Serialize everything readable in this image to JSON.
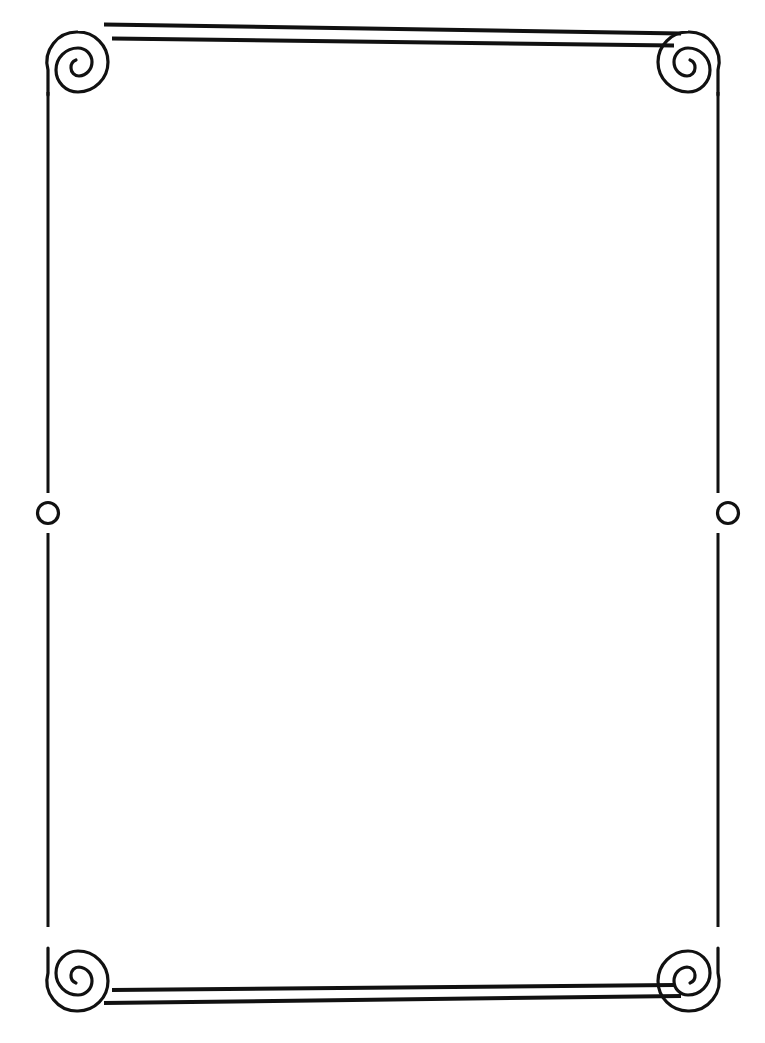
{
  "document": {
    "title": "Decorative Border Frame",
    "kind": "ornamental-page-border",
    "width": 765,
    "height": 1043,
    "background_color": "#ffffff",
    "ink_color": "#111111",
    "text_content": "",
    "interior_note": ""
  },
  "frame": {
    "stroke_color": "#111111",
    "stroke_width": 3,
    "left_rail_x": 48,
    "right_rail_x": 718,
    "top_rail_y": 62,
    "bottom_rail_y": 957
  },
  "corners": [
    {
      "name": "top-left-spiral",
      "position": "top-left",
      "center_x": 78,
      "center_y": 62,
      "outer_radius": 30,
      "inner_radius": 9,
      "turn_direction": "inward-counterclockwise"
    },
    {
      "name": "top-right-spiral",
      "position": "top-right",
      "center_x": 688,
      "center_y": 62,
      "outer_radius": 30,
      "inner_radius": 9,
      "turn_direction": "inward-clockwise"
    },
    {
      "name": "bottom-left-spiral",
      "position": "bottom-left",
      "center_x": 78,
      "center_y": 957,
      "outer_radius": 30,
      "inner_radius": 9,
      "turn_direction": "inward-clockwise"
    },
    {
      "name": "bottom-right-spiral",
      "position": "bottom-right",
      "center_x": 688,
      "center_y": 957,
      "outer_radius": 30,
      "inner_radius": 9,
      "turn_direction": "inward-counterclockwise"
    }
  ],
  "side_medallions": [
    {
      "name": "left-circle-ornament",
      "side": "left",
      "center_x": 48,
      "center_y": 513,
      "radius": 10,
      "stroke_width": 3,
      "filled": false,
      "gap_top_y": 493,
      "gap_bottom_y": 533
    },
    {
      "name": "right-circle-ornament",
      "side": "right",
      "center_x": 728,
      "center_y": 513,
      "radius": 10,
      "stroke_width": 3,
      "filled": false,
      "gap_top_y": 493,
      "gap_bottom_y": 533
    }
  ],
  "rules": [
    {
      "name": "top-outer-rule",
      "edge": "top",
      "x1": 104,
      "y1": 24,
      "x2": 681,
      "y2": 33,
      "thickness": 4
    },
    {
      "name": "top-inner-rule",
      "edge": "top",
      "x1": 112,
      "y1": 38,
      "x2": 674,
      "y2": 45,
      "thickness": 4
    },
    {
      "name": "bottom-inner-rule",
      "edge": "bottom",
      "x1": 112,
      "y1": 990,
      "x2": 674,
      "y2": 985,
      "thickness": 4
    },
    {
      "name": "bottom-outer-rule",
      "edge": "bottom",
      "x1": 104,
      "y1": 1003,
      "x2": 681,
      "y2": 996,
      "thickness": 4
    }
  ]
}
